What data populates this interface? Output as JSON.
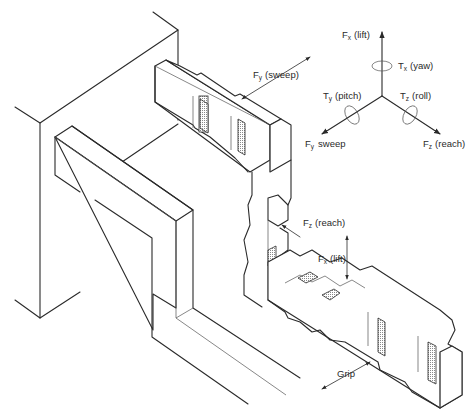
{
  "diagram": {
    "type": "isometric technical illustration",
    "colors": {
      "line": "#2a2a2a",
      "background": "#ffffff",
      "hatch": "#9a9a9a"
    }
  },
  "axes_legend": {
    "fx": {
      "symbol": "F",
      "sub": "x",
      "label": "(lift)"
    },
    "tx": {
      "symbol": "T",
      "sub": "x",
      "label": "(yaw)"
    },
    "ty": {
      "symbol": "T",
      "sub": "y",
      "label": "(pitch)"
    },
    "tz": {
      "symbol": "T",
      "sub": "z",
      "label": "(roll)"
    },
    "fy": {
      "symbol": "F",
      "sub": "y",
      "label": "sweep"
    },
    "fz": {
      "symbol": "F",
      "sub": "z",
      "label": "(reach)"
    }
  },
  "annotations": {
    "fy_sweep": {
      "symbol": "F",
      "sub": "y",
      "label": "(sweep)"
    },
    "fz_reach": {
      "symbol": "F",
      "sub": "z",
      "label": "(reach)"
    },
    "fx_lift": {
      "symbol": "F",
      "sub": "x",
      "label": "(lift)"
    },
    "grip": {
      "label": "Grip"
    }
  }
}
